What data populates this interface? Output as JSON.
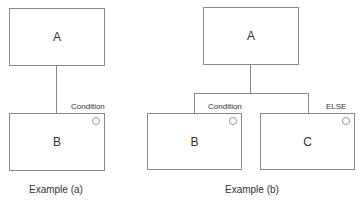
{
  "example_a": {
    "box_top": "A",
    "box_bottom": "B",
    "condition_label": "Condition",
    "caption": "Example (a)"
  },
  "example_b": {
    "box_top": "A",
    "box_left": "B",
    "box_right": "C",
    "condition_label": "Condition",
    "else_label": "ELSE",
    "caption": "Example (b)"
  }
}
